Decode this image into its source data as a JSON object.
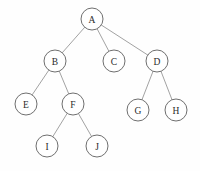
{
  "diagram": {
    "type": "tree",
    "canvas": {
      "width": 200,
      "height": 171
    },
    "style": {
      "background_color": "#fefefe",
      "node_fill": "#ffffff",
      "node_stroke": "#6f6f6f",
      "edge_stroke": "#8a8a8a",
      "label_color": "#2a2a2a",
      "node_radius": 11
    },
    "nodes": [
      {
        "id": "A",
        "label": "A",
        "cx": 92,
        "cy": 19,
        "r": 11,
        "level": 0
      },
      {
        "id": "B",
        "label": "B",
        "cx": 55,
        "cy": 61,
        "r": 11,
        "level": 1
      },
      {
        "id": "C",
        "label": "C",
        "cx": 114,
        "cy": 61,
        "r": 11,
        "level": 1
      },
      {
        "id": "D",
        "label": "D",
        "cx": 157,
        "cy": 61,
        "r": 11,
        "level": 1
      },
      {
        "id": "E",
        "label": "E",
        "cx": 26,
        "cy": 104,
        "r": 11,
        "level": 2
      },
      {
        "id": "F",
        "label": "F",
        "cx": 73,
        "cy": 104,
        "r": 11,
        "level": 2
      },
      {
        "id": "G",
        "label": "G",
        "cx": 138,
        "cy": 110,
        "r": 11,
        "level": 2
      },
      {
        "id": "H",
        "label": "H",
        "cx": 176,
        "cy": 110,
        "r": 11,
        "level": 2
      },
      {
        "id": "I",
        "label": "I",
        "cx": 47,
        "cy": 146,
        "r": 11,
        "level": 3
      },
      {
        "id": "J",
        "label": "J",
        "cx": 97,
        "cy": 146,
        "r": 11,
        "level": 3
      }
    ],
    "edges": [
      {
        "from": "A",
        "to": "B"
      },
      {
        "from": "A",
        "to": "C"
      },
      {
        "from": "A",
        "to": "D"
      },
      {
        "from": "B",
        "to": "E"
      },
      {
        "from": "B",
        "to": "F"
      },
      {
        "from": "D",
        "to": "G"
      },
      {
        "from": "D",
        "to": "H"
      },
      {
        "from": "F",
        "to": "I"
      },
      {
        "from": "F",
        "to": "J"
      }
    ]
  }
}
